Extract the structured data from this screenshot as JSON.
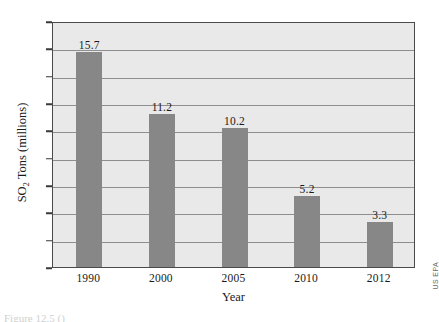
{
  "chart_data": {
    "type": "bar",
    "title": "",
    "categories": [
      "1990",
      "2000",
      "2005",
      "2010",
      "2012"
    ],
    "values": [
      15.7,
      11.2,
      10.2,
      5.2,
      3.3
    ],
    "value_labels": [
      "15.7",
      "11.2",
      "10.2",
      "5.2",
      "3.3"
    ],
    "xlabel": "Year",
    "ylabel": "SO2 Tons (millions)",
    "ylabel_parts": {
      "pre": "SO",
      "sub": "2",
      "post": " Tons (millions)"
    },
    "ylim": [
      0,
      18
    ],
    "ytick_step": 2,
    "yticks": [
      "18",
      "16",
      "14",
      "12",
      "10",
      "8",
      "6",
      "4",
      "2",
      "0"
    ],
    "ytick_values": [
      18,
      16,
      14,
      12,
      10,
      8,
      6,
      4,
      2,
      0
    ],
    "grid": "horizontal",
    "legend": "none",
    "bar_color": "#878787",
    "plot_background": "#e9e9e9",
    "gridline_color": "#8e8e8e",
    "axis_color": "#4a4a4a"
  },
  "credit": {
    "source": "US EPA"
  },
  "caption": {
    "fragment": "Figure 12.5 ()"
  }
}
